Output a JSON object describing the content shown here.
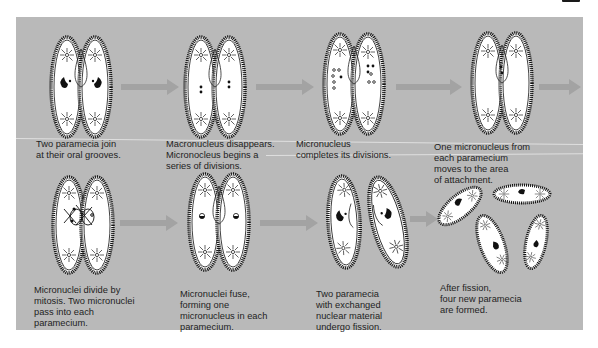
{
  "figure": {
    "panel_color": "#b9b9b9",
    "arrow_color": "#a3a3a3",
    "rows": [
      {
        "steps": [
          {
            "id": 1,
            "caption": "Two paramecia join\nat their oral grooves.",
            "illustration": "two-paramecia-joined-icon"
          },
          {
            "id": 2,
            "caption": "Macronucleus disappears.\nMicronocleus begins a\nseries of divisions.",
            "illustration": "paramecia-micronucleus-dividing-icon"
          },
          {
            "id": 3,
            "caption": "Micronucleus\ncompletes its divisions.",
            "illustration": "paramecia-divisions-complete-icon"
          },
          {
            "id": 4,
            "caption": "One micronucleus from\neach paramecium\nmoves to the area\nof attachment.",
            "illustration": "paramecia-attachment-icon"
          }
        ]
      },
      {
        "steps": [
          {
            "id": 5,
            "caption": "Micronuclei divide by\nmitosis.  Two micronuclei\npass into each\nparamecium.",
            "illustration": "paramecia-mitosis-exchange-icon"
          },
          {
            "id": 6,
            "caption": "Micronuclei fuse,\nforming one\nmicronucleus in each\nparamecium.",
            "illustration": "paramecia-micronuclei-fused-icon"
          },
          {
            "id": 7,
            "caption": "Two paramecia\nwith exchanged\nnuclear material\nundergo fission.",
            "illustration": "paramecia-separated-icon"
          },
          {
            "id": 8,
            "caption": "After fission,\nfour new paramecia\nare formed.",
            "illustration": "four-new-paramecia-icon"
          }
        ]
      }
    ]
  }
}
